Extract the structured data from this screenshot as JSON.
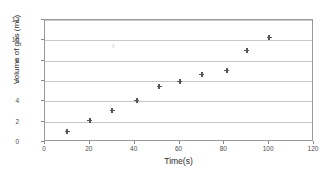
{
  "chart_data": {
    "type": "scatter",
    "title": "",
    "xlabel": "Time(s)",
    "ylabel": "Volume of gas (mL)",
    "xlim": [
      0,
      120
    ],
    "ylim": [
      0,
      12
    ],
    "xticks": [
      0,
      20,
      40,
      60,
      80,
      100,
      120
    ],
    "yticks": [
      0,
      2,
      4,
      6,
      8,
      10,
      12
    ],
    "grid": "horizontal",
    "legend": "none",
    "marker": "cross",
    "marker_color": "#555555",
    "series": [
      {
        "name": "Volume of gas",
        "x": [
          10,
          20,
          30,
          41,
          51,
          60,
          70,
          81,
          90,
          100
        ],
        "y": [
          1.0,
          2.1,
          3.1,
          4.1,
          5.5,
          6.0,
          6.6,
          7.0,
          9.0,
          10.3
        ]
      }
    ]
  },
  "axes": {
    "x_tick_labels": [
      "0",
      "20",
      "40",
      "60",
      "80",
      "100",
      "120"
    ],
    "y_tick_labels": [
      "0",
      "2",
      "4",
      "6",
      "8",
      "10",
      "12"
    ],
    "x_title": "Time(s)",
    "y_title": "Volume of gas (mL)"
  },
  "colors": {
    "plot_border": "#9a9a9a",
    "gridline": "#c8c8c8",
    "marker": "#555555",
    "tick_text": "#4d4d4d",
    "axis_title_text": "#2b2b2b",
    "background": "#ffffff"
  }
}
